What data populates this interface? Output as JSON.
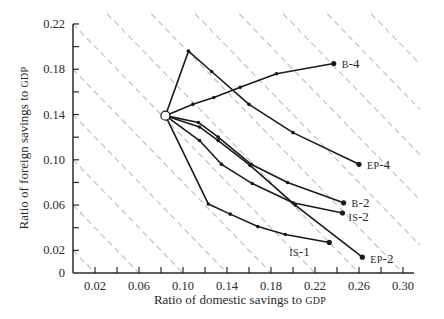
{
  "chart_data": {
    "type": "line",
    "title": "",
    "xlabel": "Ratio of domestic savings to",
    "xlabel_sc": "GDP",
    "ylabel": "Ratio of foreign savings to",
    "ylabel_sc": "GDP",
    "xlim": [
      0,
      0.31
    ],
    "ylim": [
      0,
      0.22
    ],
    "x_ticks": [
      0.02,
      0.04,
      0.06,
      0.08,
      0.1,
      0.12,
      0.14,
      0.16,
      0.18,
      0.2,
      0.22,
      0.24,
      0.26,
      0.28,
      0.3
    ],
    "x_tick_labels": [
      "0.02",
      "0.06",
      "0.10",
      "0.14",
      "0.18",
      "0.22",
      "0.26",
      "0.30"
    ],
    "x_tick_label_values": [
      0.02,
      0.06,
      0.1,
      0.14,
      0.18,
      0.22,
      0.26,
      0.3
    ],
    "y_ticks": [
      0,
      0.02,
      0.04,
      0.06,
      0.08,
      0.1,
      0.12,
      0.14,
      0.16,
      0.18,
      0.2,
      0.22
    ],
    "y_tick_labels": [
      "0",
      "0.02",
      "0.06",
      "0.10",
      "0.14",
      "0.18",
      "0.22"
    ],
    "y_tick_label_values": [
      0,
      0.02,
      0.06,
      0.1,
      0.14,
      0.18,
      0.22
    ],
    "grid": false,
    "iso_lines": {
      "style": "dashed",
      "color": "#bdbdbd",
      "description": "lines of constant total savings (domestic + foreign)",
      "sums": [
        0.02,
        0.06,
        0.1,
        0.14,
        0.18,
        0.22,
        0.26,
        0.3,
        0.34,
        0.38,
        0.42,
        0.46,
        0.5
      ]
    },
    "start_point": {
      "x": 0.084,
      "y": 0.139,
      "marker": "open-circle"
    },
    "series": [
      {
        "name": "EP-4",
        "label": "EP-4",
        "x": [
          0.084,
          0.105,
          0.126,
          0.16,
          0.2,
          0.26
        ],
        "y": [
          0.139,
          0.196,
          0.178,
          0.149,
          0.124,
          0.096
        ]
      },
      {
        "name": "B-4",
        "label": "B-4",
        "x": [
          0.084,
          0.109,
          0.128,
          0.152,
          0.185,
          0.237
        ],
        "y": [
          0.139,
          0.149,
          0.155,
          0.164,
          0.176,
          0.185
        ]
      },
      {
        "name": "B-2",
        "label": "B-2",
        "x": [
          0.084,
          0.114,
          0.132,
          0.162,
          0.195,
          0.246
        ],
        "y": [
          0.139,
          0.133,
          0.12,
          0.096,
          0.08,
          0.062
        ]
      },
      {
        "name": "EP-2",
        "label": "EP-2",
        "x": [
          0.084,
          0.115,
          0.132,
          0.161,
          0.202,
          0.263
        ],
        "y": [
          0.139,
          0.129,
          0.117,
          0.095,
          0.06,
          0.014
        ]
      },
      {
        "name": "IS-2",
        "label": "IS-2",
        "x": [
          0.084,
          0.115,
          0.135,
          0.163,
          0.2,
          0.245
        ],
        "y": [
          0.139,
          0.117,
          0.096,
          0.079,
          0.062,
          0.053
        ]
      },
      {
        "name": "IS-1",
        "label": "IS-1",
        "x": [
          0.084,
          0.123,
          0.143,
          0.168,
          0.193,
          0.233
        ],
        "y": [
          0.139,
          0.061,
          0.052,
          0.041,
          0.034,
          0.027
        ]
      }
    ],
    "colors": {
      "line": "#1a1a1a",
      "axis": "#2a2a2a",
      "iso": "#bdbdbd"
    }
  }
}
